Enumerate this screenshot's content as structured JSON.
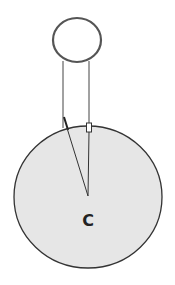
{
  "diagram": {
    "labels": {
      "center": "C"
    },
    "colors": {
      "background": "#ffffff",
      "large_circle_fill": "#e6e6e6",
      "stroke": "#333333",
      "small_circle_stroke": "#555555"
    },
    "elements": {
      "small_circle": {
        "cx": 77,
        "cy": 40,
        "rx": 24,
        "ry": 22
      },
      "large_circle": {
        "cx": 88,
        "cy": 197,
        "rx": 74,
        "ry": 71
      },
      "left_string": {
        "x": 63,
        "y1": 62,
        "y2": 128
      },
      "right_string": {
        "x": 89,
        "y1": 62,
        "y2": 128
      },
      "convergence_point": {
        "x": 88,
        "y": 196
      }
    }
  }
}
